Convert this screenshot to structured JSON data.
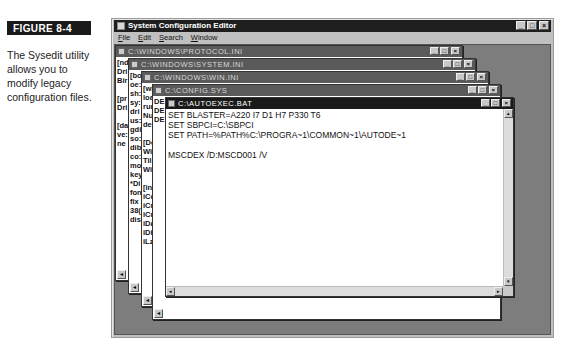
{
  "figure": {
    "label": "FIGURE 8-4",
    "caption": "The Sysedit utility allows you to modify legacy configuration files."
  },
  "app": {
    "title": "System Configuration Editor",
    "menu": [
      "File",
      "Edit",
      "Search",
      "Window"
    ],
    "controls": {
      "minimize": "_",
      "maximize": "□",
      "close": "×"
    }
  },
  "windows": [
    {
      "title": "C:\\WINDOWS\\PROTOCOL.INI",
      "active": false,
      "visible_lines": [
        "[nd",
        "Dri",
        "Bir",
        "",
        "[pr",
        "Dri",
        "",
        "[da",
        "ve:",
        "ne"
      ]
    },
    {
      "title": "C:\\WINDOWS\\SYSTEM.INI",
      "active": false,
      "visible_lines": [
        "[bo",
        "oe:",
        "sh:",
        "sy:",
        "dri",
        "us:",
        "gdi",
        "so:",
        "dib",
        "co:",
        "mo",
        "key",
        "*Di",
        "fon",
        "fix",
        "38(",
        "dis"
      ]
    },
    {
      "title": "C:\\WINDOWS\\WIN.INI",
      "active": false,
      "visible_lines": [
        "[wi",
        "loa",
        "rur",
        "Nu",
        "de",
        "",
        "[De",
        "Wi",
        "Til",
        "Wi",
        "",
        "[in",
        "iCo",
        "iCu",
        "iCu",
        "iDa",
        "iDi",
        "iLz"
      ]
    },
    {
      "title": "C:\\CONFIG.SYS",
      "active": false,
      "visible_lines": [
        "DE",
        "DE",
        "DE"
      ]
    },
    {
      "title": "C:\\AUTOEXEC.BAT",
      "active": true,
      "lines": [
        "SET BLASTER=A220 I7 D1 H7 P330 T6",
        "SET SBPCI=C:\\SBPCI",
        "SET PATH=%PATH%C:\\PROGRA~1\\COMMON~1\\AUTODE~1",
        "",
        "MSCDEX /D:MSCD001 /V"
      ]
    }
  ],
  "colors": {
    "active_title": "#1a1a1a",
    "inactive_title": "#5a5a5a",
    "mdi_background": "#7d7d7d",
    "chrome": "#c0c0c0"
  }
}
